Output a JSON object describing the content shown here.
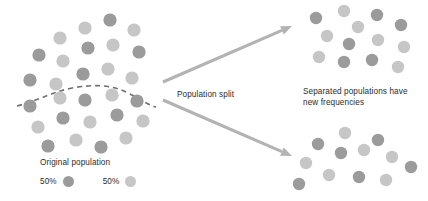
{
  "diagram": {
    "title_text_blocks": {
      "population_split": "Population split",
      "separated_line1": "Separated populations have",
      "separated_line2": "new frequencies",
      "original_population": "Original population"
    },
    "legend": {
      "entries": [
        {
          "label": "50%",
          "swatch_name": "allele-dark-swatch",
          "color": "#9b9b9b"
        },
        {
          "label": "50%",
          "swatch_name": "allele-light-swatch",
          "color": "#c6c6c6"
        }
      ]
    },
    "colors": {
      "background": "#ffffff",
      "text": "#2b2b2b",
      "dot_dark": "#9b9b9b",
      "dot_light": "#c6c6c6",
      "arrow": "#b3b3b3",
      "dashed_line": "#6e6e6e"
    },
    "arrows": [
      {
        "name": "arrow-to-top-population",
        "from": [
          163,
          82
        ],
        "to": [
          292,
          26
        ]
      },
      {
        "name": "arrow-to-bottom-population",
        "from": [
          163,
          100
        ],
        "to": [
          292,
          156
        ]
      }
    ],
    "dashed_divider": {
      "name": "population-split-dashed-curve",
      "path": "M 17 106 C 40 100 52 92 72 88 C 94 84 112 85 126 92 C 140 99 146 104 156 107"
    },
    "populations": [
      {
        "name": "original-population",
        "dots": [
          {
            "cx": 60,
            "cy": 38,
            "r": 6.6,
            "shade": "light"
          },
          {
            "cx": 85,
            "cy": 28,
            "r": 6.6,
            "shade": "light"
          },
          {
            "cx": 110,
            "cy": 20,
            "r": 6.6,
            "shade": "dark"
          },
          {
            "cx": 134,
            "cy": 30,
            "r": 6.6,
            "shade": "light"
          },
          {
            "cx": 39,
            "cy": 55,
            "r": 6.6,
            "shade": "dark"
          },
          {
            "cx": 63,
            "cy": 61,
            "r": 6.6,
            "shade": "light"
          },
          {
            "cx": 88,
            "cy": 48,
            "r": 6.6,
            "shade": "dark"
          },
          {
            "cx": 113,
            "cy": 45,
            "r": 6.6,
            "shade": "light"
          },
          {
            "cx": 139,
            "cy": 52,
            "r": 6.6,
            "shade": "dark"
          },
          {
            "cx": 30,
            "cy": 80,
            "r": 6.6,
            "shade": "dark"
          },
          {
            "cx": 56,
            "cy": 84,
            "r": 6.6,
            "shade": "light"
          },
          {
            "cx": 83,
            "cy": 74,
            "r": 6.6,
            "shade": "dark"
          },
          {
            "cx": 108,
            "cy": 69,
            "r": 6.6,
            "shade": "light"
          },
          {
            "cx": 132,
            "cy": 78,
            "r": 6.6,
            "shade": "light"
          },
          {
            "cx": 30,
            "cy": 106,
            "r": 6.6,
            "shade": "dark"
          },
          {
            "cx": 60,
            "cy": 98,
            "r": 6.6,
            "shade": "light"
          },
          {
            "cx": 85,
            "cy": 100,
            "r": 6.6,
            "shade": "dark"
          },
          {
            "cx": 112,
            "cy": 95,
            "r": 6.6,
            "shade": "light"
          },
          {
            "cx": 137,
            "cy": 101,
            "r": 6.6,
            "shade": "dark"
          },
          {
            "cx": 38,
            "cy": 127,
            "r": 6.6,
            "shade": "light"
          },
          {
            "cx": 63,
            "cy": 118,
            "r": 6.6,
            "shade": "dark"
          },
          {
            "cx": 90,
            "cy": 122,
            "r": 6.6,
            "shade": "light"
          },
          {
            "cx": 117,
            "cy": 115,
            "r": 6.6,
            "shade": "dark"
          },
          {
            "cx": 143,
            "cy": 121,
            "r": 6.6,
            "shade": "light"
          },
          {
            "cx": 48,
            "cy": 146,
            "r": 6.6,
            "shade": "dark"
          },
          {
            "cx": 76,
            "cy": 140,
            "r": 6.6,
            "shade": "light"
          },
          {
            "cx": 101,
            "cy": 147,
            "r": 6.6,
            "shade": "dark"
          },
          {
            "cx": 126,
            "cy": 138,
            "r": 6.6,
            "shade": "light"
          }
        ]
      },
      {
        "name": "separated-population-top",
        "dots": [
          {
            "cx": 316,
            "cy": 18,
            "r": 6.2,
            "shade": "dark"
          },
          {
            "cx": 344,
            "cy": 11,
            "r": 6.2,
            "shade": "light"
          },
          {
            "cx": 377,
            "cy": 15,
            "r": 6.2,
            "shade": "dark"
          },
          {
            "cx": 358,
            "cy": 27,
            "r": 6.2,
            "shade": "light"
          },
          {
            "cx": 401,
            "cy": 25,
            "r": 6.2,
            "shade": "dark"
          },
          {
            "cx": 327,
            "cy": 36,
            "r": 6.2,
            "shade": "light"
          },
          {
            "cx": 349,
            "cy": 44,
            "r": 6.2,
            "shade": "dark"
          },
          {
            "cx": 378,
            "cy": 40,
            "r": 6.2,
            "shade": "light"
          },
          {
            "cx": 404,
            "cy": 47,
            "r": 6.2,
            "shade": "light"
          },
          {
            "cx": 319,
            "cy": 57,
            "r": 6.2,
            "shade": "light"
          },
          {
            "cx": 344,
            "cy": 62,
            "r": 6.2,
            "shade": "dark"
          },
          {
            "cx": 372,
            "cy": 60,
            "r": 6.2,
            "shade": "dark"
          },
          {
            "cx": 398,
            "cy": 67,
            "r": 6.2,
            "shade": "light"
          }
        ]
      },
      {
        "name": "separated-population-bottom",
        "dots": [
          {
            "cx": 345,
            "cy": 133,
            "r": 6.2,
            "shade": "light"
          },
          {
            "cx": 318,
            "cy": 144,
            "r": 6.2,
            "shade": "dark"
          },
          {
            "cx": 378,
            "cy": 140,
            "r": 6.2,
            "shade": "dark"
          },
          {
            "cx": 341,
            "cy": 153,
            "r": 6.2,
            "shade": "dark"
          },
          {
            "cx": 364,
            "cy": 150,
            "r": 6.2,
            "shade": "light"
          },
          {
            "cx": 392,
            "cy": 157,
            "r": 6.2,
            "shade": "light"
          },
          {
            "cx": 306,
            "cy": 163,
            "r": 6.2,
            "shade": "light"
          },
          {
            "cx": 411,
            "cy": 167,
            "r": 6.2,
            "shade": "dark"
          },
          {
            "cx": 329,
            "cy": 175,
            "r": 6.2,
            "shade": "light"
          },
          {
            "cx": 359,
            "cy": 177,
            "r": 6.2,
            "shade": "dark"
          },
          {
            "cx": 386,
            "cy": 180,
            "r": 6.2,
            "shade": "light"
          },
          {
            "cx": 299,
            "cy": 184,
            "r": 6.2,
            "shade": "dark"
          }
        ]
      }
    ]
  }
}
